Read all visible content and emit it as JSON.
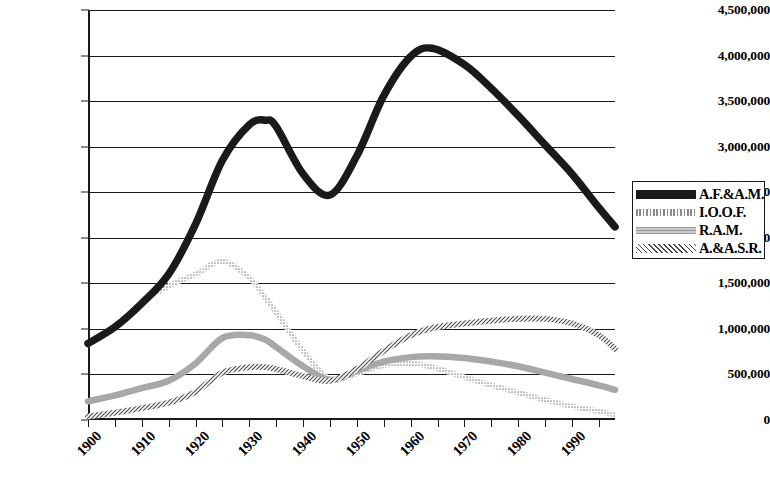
{
  "chart_data": {
    "type": "line",
    "title": "",
    "subtitle": "",
    "xlabel": "",
    "ylabel": "",
    "xlim": [
      1900,
      1998
    ],
    "ylim": [
      0,
      4500000
    ],
    "grid": true,
    "grid_axis": "y",
    "legend_position": "right-outside",
    "y_ticks": [
      0,
      500000,
      1000000,
      1500000,
      2000000,
      2500000,
      3000000,
      3500000,
      4000000,
      4500000
    ],
    "y_tick_labels": [
      "0",
      "500,000",
      "1,000,000",
      "1,500,000",
      "2,000,000",
      "2,500,000",
      "3,000,000",
      "3,500,000",
      "4,000,000",
      "4,500,000"
    ],
    "x_ticks": [
      1900,
      1905,
      1910,
      1915,
      1920,
      1925,
      1930,
      1935,
      1940,
      1945,
      1950,
      1955,
      1960,
      1965,
      1970,
      1975,
      1980,
      1985,
      1990,
      1995
    ],
    "x_tick_labels": [
      "1900",
      "1910",
      "1920",
      "1930",
      "1940",
      "1950",
      "1960",
      "1970",
      "1980",
      "1990"
    ],
    "x_labeled_ticks": [
      1900,
      1910,
      1920,
      1930,
      1940,
      1950,
      1960,
      1970,
      1980,
      1990
    ],
    "x": [
      1900,
      1905,
      1910,
      1915,
      1920,
      1925,
      1930,
      1933,
      1935,
      1940,
      1945,
      1950,
      1955,
      1960,
      1964,
      1970,
      1975,
      1980,
      1985,
      1990,
      1995,
      1998
    ],
    "series": [
      {
        "name": "A.F.&A.M.",
        "style": "thick-solid-black",
        "color": "#1a1a1a",
        "values": [
          840000,
          1020000,
          1280000,
          1600000,
          2150000,
          2850000,
          3240000,
          3290000,
          3220000,
          2700000,
          2470000,
          2900000,
          3560000,
          3990000,
          4080000,
          3900000,
          3640000,
          3340000,
          3020000,
          2700000,
          2330000,
          2120000
        ]
      },
      {
        "name": "I.O.O.F.",
        "style": "light-dotted",
        "color": "#b4b4b4",
        "values": [
          830000,
          1020000,
          1290000,
          1470000,
          1600000,
          1740000,
          1560000,
          1340000,
          1180000,
          760000,
          450000,
          510000,
          600000,
          620000,
          580000,
          470000,
          380000,
          300000,
          220000,
          150000,
          95000,
          60000
        ]
      },
      {
        "name": "R.A.M.",
        "style": "medium-gray",
        "color": "#9e9e9e",
        "values": [
          205000,
          270000,
          350000,
          430000,
          620000,
          900000,
          930000,
          880000,
          800000,
          590000,
          440000,
          540000,
          640000,
          690000,
          700000,
          680000,
          640000,
          590000,
          520000,
          450000,
          380000,
          330000
        ]
      },
      {
        "name": "A.&A.S.R.",
        "style": "dark-hatched",
        "color": "#555555",
        "values": [
          40000,
          80000,
          130000,
          190000,
          310000,
          520000,
          580000,
          580000,
          560000,
          480000,
          430000,
          560000,
          760000,
          930000,
          1010000,
          1060000,
          1090000,
          1110000,
          1110000,
          1060000,
          930000,
          780000
        ]
      }
    ]
  },
  "legend": {
    "items": [
      {
        "label": "A.F.&A.M."
      },
      {
        "label": "I.O.O.F."
      },
      {
        "label": "R.A.M."
      },
      {
        "label": "A.&A.S.R."
      }
    ]
  }
}
